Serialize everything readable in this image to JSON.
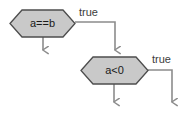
{
  "diagram": {
    "type": "flowchart",
    "title": "",
    "canvas": {
      "width": 184,
      "height": 119,
      "background": "#ffffff"
    },
    "style": {
      "node_fill": "#c9c9c9",
      "node_stroke": "#4d4d4d",
      "edge_stroke": "#8c8c8c",
      "text_color": "#1a1a1a",
      "label_color": "#3c3c3c"
    },
    "nodes": [
      {
        "id": "decision-a-eq-b",
        "shape": "hexagon",
        "label": "a==b",
        "x": 10,
        "y": 10,
        "width": 65,
        "height": 27
      },
      {
        "id": "decision-a-lt-0",
        "shape": "hexagon",
        "label": "a<0",
        "x": 81,
        "y": 57,
        "width": 67,
        "height": 27
      }
    ],
    "edges": [
      {
        "id": "edge-a-eq-b-true",
        "from": "decision-a-eq-b",
        "to": "decision-a-lt-0",
        "label": "true",
        "label_x": 79,
        "label_y": 13,
        "arrow": true
      },
      {
        "id": "edge-a-eq-b-false",
        "from": "decision-a-eq-b",
        "to": "",
        "label": "",
        "arrow": true
      },
      {
        "id": "edge-a-lt-0-true",
        "from": "decision-a-lt-0",
        "to": "",
        "label": "true",
        "label_x": 152,
        "label_y": 60,
        "arrow": true
      },
      {
        "id": "edge-a-lt-0-false",
        "from": "decision-a-lt-0",
        "to": "",
        "label": "",
        "arrow": true
      }
    ]
  }
}
